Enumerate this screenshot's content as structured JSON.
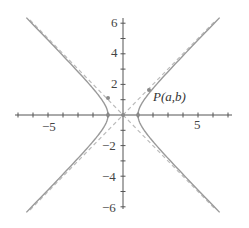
{
  "chart_data": {
    "type": "line",
    "title": "",
    "xlabel": "",
    "ylabel": "",
    "xlim": [
      -7.2,
      7.3
    ],
    "ylim": [
      -6.2,
      6.3
    ],
    "grid": false,
    "x_ticks": [
      -7,
      -6,
      -5,
      -4,
      -3,
      -2,
      -1,
      1,
      2,
      3,
      4,
      5,
      6,
      7
    ],
    "y_ticks": [
      -6,
      -5,
      -4,
      -3,
      -2,
      -1,
      1,
      2,
      3,
      4,
      5,
      6
    ],
    "x_tick_labels": [
      {
        "value": -5,
        "text": "−5"
      },
      {
        "value": 5,
        "text": "5"
      }
    ],
    "y_tick_labels": [
      {
        "value": 6,
        "text": "6"
      },
      {
        "value": 4,
        "text": "4"
      },
      {
        "value": 2,
        "text": "2"
      },
      {
        "value": -2,
        "text": "−2"
      },
      {
        "value": -4,
        "text": "−4"
      },
      {
        "value": -6,
        "text": "−6"
      }
    ],
    "series": [
      {
        "name": "hyperbola",
        "equation": "x^2 - y^2 = 1",
        "style": "solid",
        "color": "#9a9a9a"
      },
      {
        "name": "asymptote y = x",
        "equation": "y = x",
        "style": "dashed",
        "color": "#bcbcbc"
      },
      {
        "name": "asymptote y = -x",
        "equation": "y = -x",
        "style": "dashed",
        "color": "#bcbcbc"
      }
    ],
    "points": [
      {
        "name": "P",
        "label": "P(a,b)",
        "x": 1.73,
        "y": 1.6
      },
      {
        "name": "Q",
        "label": "",
        "x": -1.0,
        "y": 1.1
      },
      {
        "name": "vertex-left",
        "label": "",
        "x": -1,
        "y": 0
      },
      {
        "name": "vertex-right",
        "label": "",
        "x": 1,
        "y": 0
      },
      {
        "name": "origin",
        "label": "",
        "x": 0,
        "y": 0
      }
    ]
  },
  "labels": {
    "point_p": "P(a,b)",
    "x_neg5": "−5",
    "x_5": "5",
    "y_6": "6",
    "y_4": "4",
    "y_2": "2",
    "y_neg2": "−2",
    "y_neg4": "−4",
    "y_neg6": "−6"
  },
  "colors": {
    "axis": "#555555",
    "curve": "#9a9a9a",
    "asymptote": "#bcbcbc",
    "point": "#8a8a8a"
  }
}
